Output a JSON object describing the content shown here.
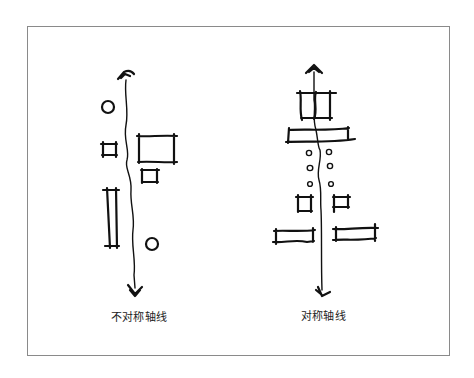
{
  "diagram": {
    "panels": [
      {
        "id": "asymmetric",
        "caption": "不对称轴线",
        "axis": {
          "arrow_top": "open-chevron-up",
          "arrow_bottom": "open-chevron-down"
        },
        "elements": [
          "circle",
          "small-square",
          "large-rectangle",
          "small-rectangle",
          "tall-rectangle",
          "circle"
        ]
      },
      {
        "id": "symmetric",
        "caption": "对称轴线",
        "axis": {
          "arrow_top": "open-chevron-up",
          "arrow_bottom": "open-chevron-down"
        },
        "elements": [
          "square-on-axis",
          "wide-bar-on-axis",
          "dot-pair",
          "dot-pair",
          "dot-pair",
          "small-square-pair",
          "flat-rectangle-pair"
        ]
      }
    ],
    "frame_color": "#8a8a8a",
    "ink_color": "#111111"
  }
}
